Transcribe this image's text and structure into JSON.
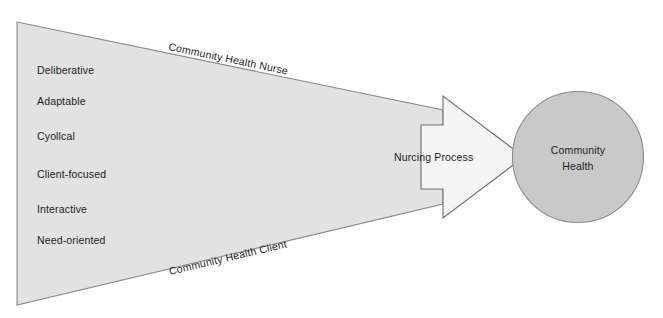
{
  "diagram": {
    "colors": {
      "background": "#ffffff",
      "wedge_fill": "#e2e2e2",
      "wedge_stroke": "#8a8a8a",
      "arrow_fill": "#f4f4f4",
      "arrow_stroke": "#6e6e6e",
      "circle_fill": "#c9c9c9",
      "circle_stroke": "#8a8a8a",
      "text": "#1c1c1c"
    },
    "wedge": {
      "top_edge_label": "Community Health Nurse",
      "bottom_edge_label": "Community Health Client",
      "attributes": [
        "Deliberative",
        "Adaptable",
        "Cyollcal",
        "Client-focused",
        "Interactive",
        "Need-oriented"
      ]
    },
    "arrow": {
      "label": "Nurcing Process"
    },
    "outcome_circle": {
      "line1": "Community",
      "line2": "Health"
    }
  }
}
